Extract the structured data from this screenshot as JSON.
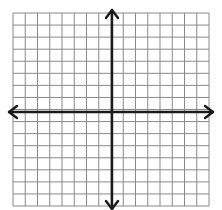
{
  "diagram": {
    "type": "coordinate-plane",
    "grid": {
      "columns": 16,
      "rows": 16,
      "left": 13,
      "top": 13,
      "right": 209,
      "bottom": 206,
      "line_color": "#8a8a8a"
    },
    "axes": {
      "color": "#1a1a1a",
      "x_axis_y": 112,
      "y_axis_x": 112,
      "x_arrow_left": 9,
      "x_arrow_right": 213,
      "y_arrow_top": 10,
      "y_arrow_bottom": 209,
      "arrows": [
        "left",
        "right",
        "up",
        "down"
      ]
    },
    "labels": []
  }
}
